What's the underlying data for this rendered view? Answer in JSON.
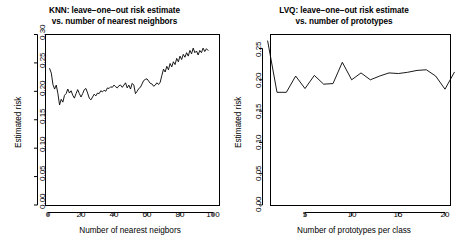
{
  "figure": {
    "background": "#ffffff",
    "line_color": "#000000",
    "width": 459,
    "height": 251
  },
  "panels": [
    {
      "id": "knn",
      "title_line1": "KNN: leave−one−out risk estimate",
      "title_line2": "vs. number of nearest neighbors",
      "xlabel": "Number of nearest neigbors",
      "ylabel": "Estimated risk",
      "xticks": [
        "0",
        "20",
        "40",
        "60",
        "80",
        "100"
      ],
      "yticks": [
        "0.00",
        "0.05",
        "0.10",
        "0.15",
        "0.20",
        "0.25",
        "0.30"
      ]
    },
    {
      "id": "lvq",
      "title_line1": "LVQ: leave−one−out risk estimate",
      "title_line2": "vs. number of prototypes",
      "xlabel": "Number of prototypes per class",
      "ylabel": "Estimated risk",
      "xticks": [
        "5",
        "10",
        "15",
        "20"
      ],
      "yticks": [
        "0.00",
        "0.05",
        "0.10",
        "0.15",
        "0.20",
        "0.25"
      ]
    }
  ],
  "chart_data": [
    {
      "type": "line",
      "id": "knn",
      "title": "KNN: leave−one−out risk estimate vs. number of nearest neighbors",
      "xlabel": "Number of nearest neigbors",
      "ylabel": "Estimated risk",
      "xlim": [
        0,
        100
      ],
      "ylim": [
        0.0,
        0.3
      ],
      "xticks": [
        0,
        20,
        40,
        60,
        80,
        100
      ],
      "yticks": [
        0.0,
        0.05,
        0.1,
        0.15,
        0.2,
        0.25,
        0.3
      ],
      "grid": false,
      "legend": "none",
      "x": [
        1,
        2,
        3,
        4,
        5,
        6,
        7,
        8,
        9,
        10,
        11,
        12,
        13,
        14,
        15,
        16,
        17,
        18,
        19,
        20,
        21,
        22,
        23,
        24,
        25,
        26,
        27,
        28,
        29,
        30,
        31,
        32,
        33,
        34,
        35,
        36,
        37,
        38,
        39,
        40,
        41,
        42,
        43,
        44,
        45,
        46,
        47,
        48,
        49,
        50,
        51,
        52,
        53,
        54,
        55,
        56,
        57,
        58,
        59,
        60,
        61,
        62,
        63,
        64,
        65,
        66,
        67,
        68,
        69,
        70,
        71,
        72,
        73,
        74,
        75,
        76,
        77,
        78,
        79,
        80,
        81,
        82,
        83,
        84,
        85,
        86,
        87,
        88,
        89,
        90,
        91,
        92,
        93,
        94,
        95,
        96,
        97
      ],
      "values": [
        0.24,
        0.232,
        0.212,
        0.204,
        0.211,
        0.196,
        0.176,
        0.186,
        0.181,
        0.193,
        0.196,
        0.204,
        0.197,
        0.201,
        0.193,
        0.188,
        0.196,
        0.203,
        0.196,
        0.19,
        0.196,
        0.203,
        0.205,
        0.197,
        0.188,
        0.185,
        0.19,
        0.195,
        0.192,
        0.197,
        0.196,
        0.201,
        0.199,
        0.202,
        0.2,
        0.206,
        0.205,
        0.208,
        0.207,
        0.211,
        0.208,
        0.206,
        0.21,
        0.211,
        0.207,
        0.211,
        0.215,
        0.206,
        0.211,
        0.204,
        0.214,
        0.211,
        0.196,
        0.2,
        0.205,
        0.207,
        0.213,
        0.219,
        0.221,
        0.222,
        0.218,
        0.214,
        0.213,
        0.209,
        0.211,
        0.215,
        0.212,
        0.216,
        0.228,
        0.239,
        0.234,
        0.244,
        0.238,
        0.249,
        0.243,
        0.252,
        0.247,
        0.258,
        0.252,
        0.262,
        0.256,
        0.265,
        0.26,
        0.268,
        0.262,
        0.272,
        0.266,
        0.276,
        0.268,
        0.271,
        0.264,
        0.272,
        0.268,
        0.276,
        0.27,
        0.275,
        0.272
      ]
    },
    {
      "type": "line",
      "id": "lvq",
      "title": "LVQ: leave−one−out risk estimate vs. number of prototypes",
      "xlabel": "Number of prototypes per class",
      "ylabel": "Estimated risk",
      "xlim": [
        1,
        21
      ],
      "ylim": [
        0.0,
        0.27
      ],
      "xticks": [
        5,
        10,
        15,
        20
      ],
      "yticks": [
        0.0,
        0.05,
        0.1,
        0.15,
        0.2,
        0.25
      ],
      "grid": false,
      "legend": "none",
      "x": [
        1,
        2,
        3,
        4,
        5,
        6,
        7,
        8,
        9,
        10,
        11,
        12,
        13,
        14,
        15,
        16,
        17,
        18,
        19,
        20,
        21
      ],
      "values": [
        0.262,
        0.18,
        0.18,
        0.206,
        0.186,
        0.207,
        0.193,
        0.194,
        0.228,
        0.2,
        0.211,
        0.2,
        0.206,
        0.211,
        0.21,
        0.212,
        0.215,
        0.216,
        0.206,
        0.185,
        0.212
      ]
    }
  ]
}
